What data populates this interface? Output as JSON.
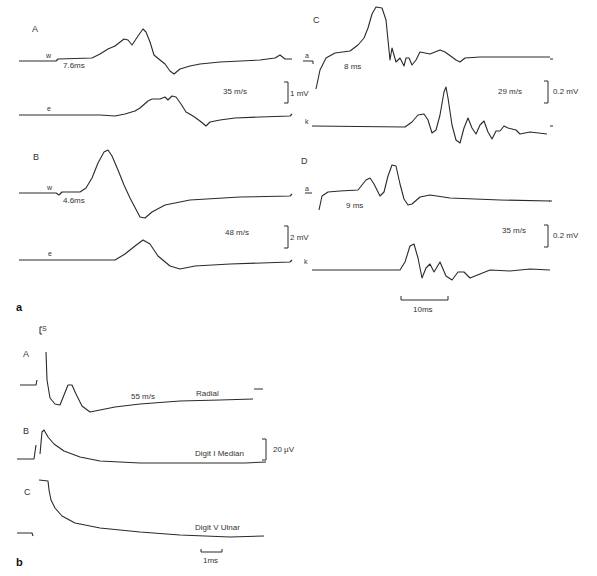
{
  "figure": {
    "part_a": {
      "label": "a",
      "panels": {
        "A": {
          "label": "A",
          "top_trace_label": "w",
          "bottom_trace_label": "e",
          "latency": "7.6ms",
          "velocity": "35 m/s",
          "scale": "1 mV"
        },
        "B": {
          "label": "B",
          "top_trace_label": "w",
          "bottom_trace_label": "e",
          "latency": "4.6ms",
          "velocity": "48 m/s",
          "scale": "2 mV"
        },
        "C": {
          "label": "C",
          "top_trace_label": "a",
          "bottom_trace_label": "k",
          "latency": "8 ms",
          "velocity": "29 m/s",
          "scale": "0.2 mV"
        },
        "D": {
          "label": "D",
          "top_trace_label": "a",
          "bottom_trace_label": "k",
          "latency": "9 ms",
          "velocity": "35 m/s",
          "scale": "0.2 mV"
        }
      },
      "time_scale": "10ms"
    },
    "part_b": {
      "label": "b",
      "stimulus_marker": "S",
      "traces": [
        {
          "label": "A",
          "nerve": "Radial",
          "velocity": "55 m/s"
        },
        {
          "label": "B",
          "nerve": "Digit I Median"
        },
        {
          "label": "C",
          "nerve": "Digit V Ulnar"
        }
      ],
      "amplitude_scale": "20 µV",
      "time_scale": "1ms"
    }
  }
}
